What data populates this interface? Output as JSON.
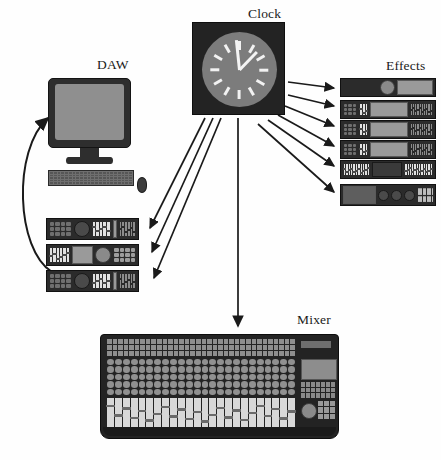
{
  "diagram": {
    "title_visible": false,
    "background_color": "#fefefe",
    "type": "system-topology"
  },
  "labels": {
    "daw": "DAW",
    "clock": "Clock",
    "effects": "Effects",
    "mixer": "Mixer"
  },
  "nodes": {
    "clock": {
      "name": "Clock",
      "role": "master-clock-source",
      "face_color": "#7c7c7c",
      "body_color": "#232323",
      "tick_count": 12,
      "hand_color": "#f4f4f4",
      "minute_hand_angle_deg": -6,
      "hour_hand_angle_deg": 44,
      "reading": "approximately 12:02"
    },
    "daw": {
      "name": "DAW",
      "role": "digital-audio-workstation",
      "parts": [
        "monitor",
        "monitor-stand",
        "keyboard",
        "mouse"
      ],
      "screen_color": "#8f8f8f",
      "chassis_color": "#2e2e2e",
      "rack_unit_count": 3
    },
    "effects": {
      "name": "Effects",
      "role": "outboard-effects-rack",
      "rack_unit_count": 6,
      "chassis_color": "#2b2b2b"
    },
    "mixer": {
      "name": "Mixer",
      "role": "mixing-console",
      "chassis_color": "#232323",
      "channel_count": 24,
      "fader_count": 24,
      "has_lcd": true,
      "has_jog_wheel": true
    }
  },
  "connections": [
    {
      "from": "clock",
      "to": "daw-rack-1",
      "style": "arrow"
    },
    {
      "from": "clock",
      "to": "daw-rack-2",
      "style": "arrow"
    },
    {
      "from": "clock",
      "to": "daw-rack-3",
      "style": "arrow"
    },
    {
      "from": "clock",
      "to": "mixer",
      "style": "arrow"
    },
    {
      "from": "clock",
      "to": "effects-unit-1",
      "style": "arrow"
    },
    {
      "from": "clock",
      "to": "effects-unit-2",
      "style": "arrow"
    },
    {
      "from": "clock",
      "to": "effects-unit-3",
      "style": "arrow"
    },
    {
      "from": "clock",
      "to": "effects-unit-4",
      "style": "arrow"
    },
    {
      "from": "clock",
      "to": "effects-unit-5",
      "style": "arrow"
    },
    {
      "from": "clock",
      "to": "effects-unit-6",
      "style": "arrow"
    },
    {
      "from": "daw-rack-stack",
      "to": "daw-monitor",
      "style": "curved-arrow"
    }
  ],
  "colors": {
    "line": "#1a1a1a",
    "text": "#1a1a1a",
    "panel_dark": "#2b2b2b",
    "panel_mid": "#6f6f6f",
    "panel_light": "#9d9d9d",
    "screen": "#9a9a9a"
  }
}
